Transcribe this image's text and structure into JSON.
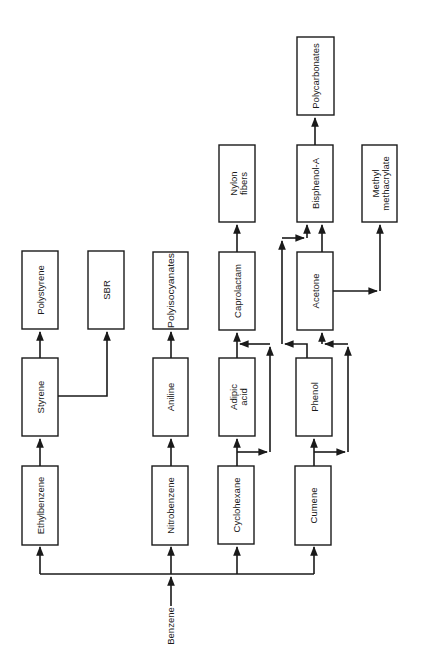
{
  "diagram": {
    "type": "flowchart",
    "orientation": "rotated-90-ccw",
    "source": {
      "label": "Benzene"
    },
    "nodes": [
      {
        "id": "ethylbenzene",
        "label": "Ethylbenzene"
      },
      {
        "id": "styrene",
        "label": "Styrene"
      },
      {
        "id": "polystyrene",
        "label": "Polystyrene"
      },
      {
        "id": "sbr",
        "label": "SBR"
      },
      {
        "id": "nitrobenzene",
        "label": "Nitrobenzene"
      },
      {
        "id": "aniline",
        "label": "Aniline"
      },
      {
        "id": "polyisocyanates",
        "label": "Polyisocyanates"
      },
      {
        "id": "cyclohexane",
        "label": "Cyclohexane"
      },
      {
        "id": "adipic_acid",
        "label_line1": "Adipic",
        "label_line2": "acid"
      },
      {
        "id": "caprolactam",
        "label": "Caprolactam"
      },
      {
        "id": "nylon_fibers",
        "label_line1": "Nylon",
        "label_line2": "fibers"
      },
      {
        "id": "cumene",
        "label": "Cumene"
      },
      {
        "id": "phenol",
        "label": "Phenol"
      },
      {
        "id": "acetone",
        "label": "Acetone"
      },
      {
        "id": "bisphenol_a",
        "label": "Bisphenol-A"
      },
      {
        "id": "polycarbonates",
        "label": "Polycarbonates"
      },
      {
        "id": "methyl_methacrylate",
        "label_line1": "Methyl",
        "label_line2": "methacrylate"
      }
    ],
    "edges": [
      [
        "benzene",
        "ethylbenzene"
      ],
      [
        "benzene",
        "nitrobenzene"
      ],
      [
        "benzene",
        "cyclohexane"
      ],
      [
        "benzene",
        "cumene"
      ],
      [
        "ethylbenzene",
        "styrene"
      ],
      [
        "styrene",
        "polystyrene"
      ],
      [
        "styrene",
        "sbr"
      ],
      [
        "nitrobenzene",
        "aniline"
      ],
      [
        "aniline",
        "polyisocyanates"
      ],
      [
        "cyclohexane",
        "adipic_acid"
      ],
      [
        "cyclohexane",
        "caprolactam"
      ],
      [
        "adipic_acid",
        "caprolactam"
      ],
      [
        "caprolactam",
        "nylon_fibers"
      ],
      [
        "cumene",
        "phenol"
      ],
      [
        "cumene",
        "acetone"
      ],
      [
        "phenol",
        "acetone"
      ],
      [
        "phenol",
        "bisphenol_a"
      ],
      [
        "acetone",
        "bisphenol_a"
      ],
      [
        "acetone",
        "methyl_methacrylate"
      ],
      [
        "bisphenol_a",
        "polycarbonates"
      ]
    ]
  }
}
